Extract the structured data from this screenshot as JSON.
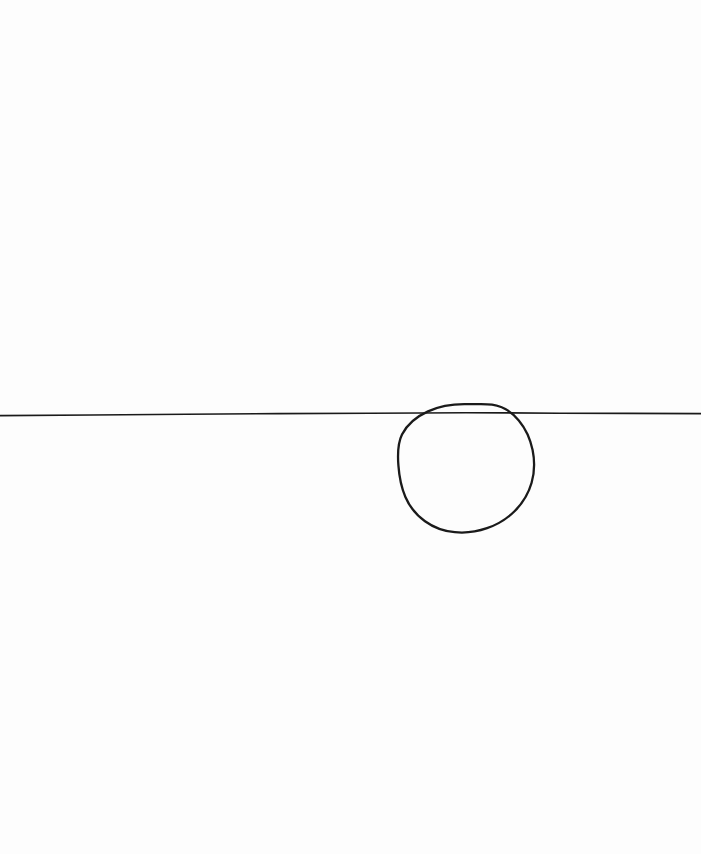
{
  "canvas": {
    "width": 701,
    "height": 854,
    "background_color": "#fdfdfd",
    "description": "Hand-drawn black ink sketch on a blank white page: a long horizontal line crossing a roughly circular shape."
  },
  "ink": {
    "color": "#1a1a1a",
    "line_stroke_width": 1.6,
    "circle_stroke_width": 2.3
  },
  "shapes": {
    "horizontal_line": {
      "name": "horizontal-line",
      "label": "Horizontal line",
      "start_x": 0,
      "start_y": 415.5,
      "end_x": 701,
      "end_y": 413.5,
      "path": "M 0 415.6 L 92 415.0 L 186 414.2 L 278 413.6 L 370 413.2 L 420 413.0 L 466 412.8 L 508 412.9 L 560 413.2 L 628 413.4 L 701 413.6"
    },
    "circle": {
      "name": "hand-drawn-circle",
      "label": "Hand-drawn circle",
      "center_x": 466,
      "center_y": 468,
      "radius": 68,
      "bounds": {
        "left": 398,
        "top": 404,
        "right": 534,
        "bottom": 532
      },
      "top_y": 404,
      "bottom_y": 532,
      "left_x": 398,
      "right_x": 534,
      "path": "M 466.0 404.2 C 452.0 404.0 438.5 406.6 428.0 411.4 C 416.5 416.6 407.0 424.6 402.0 434.6 C 397.2 444.2 397.6 455.0 398.4 465.4 C 399.2 476.4 401.2 487.2 405.4 497.0 C 409.6 506.8 416.4 515.0 425.0 521.2 C 433.6 527.4 444.0 531.2 454.8 532.2 C 465.6 533.2 476.8 531.8 487.0 528.2 C 497.4 524.6 507.0 518.8 514.8 511.0 C 522.6 503.2 528.6 493.4 531.6 482.8 C 534.6 472.2 534.8 460.8 532.6 450.0 C 530.4 439.2 525.8 428.8 518.8 420.4 C 511.8 412.0 502.4 406.0 492.0 404.6 C 483.6 403.4 474.6 404.4 466.0 404.2 Z"
    }
  },
  "intersections": {
    "left_crossing_x": 420,
    "right_crossing_x": 508,
    "line_y_at_circle": 413
  },
  "text_content": {
    "has_text": "false",
    "accessible_caption": "A nearly horizontal hand-drawn line spanning the full width of the page, intersecting the upper portion of a hand-drawn circle located right of center."
  }
}
